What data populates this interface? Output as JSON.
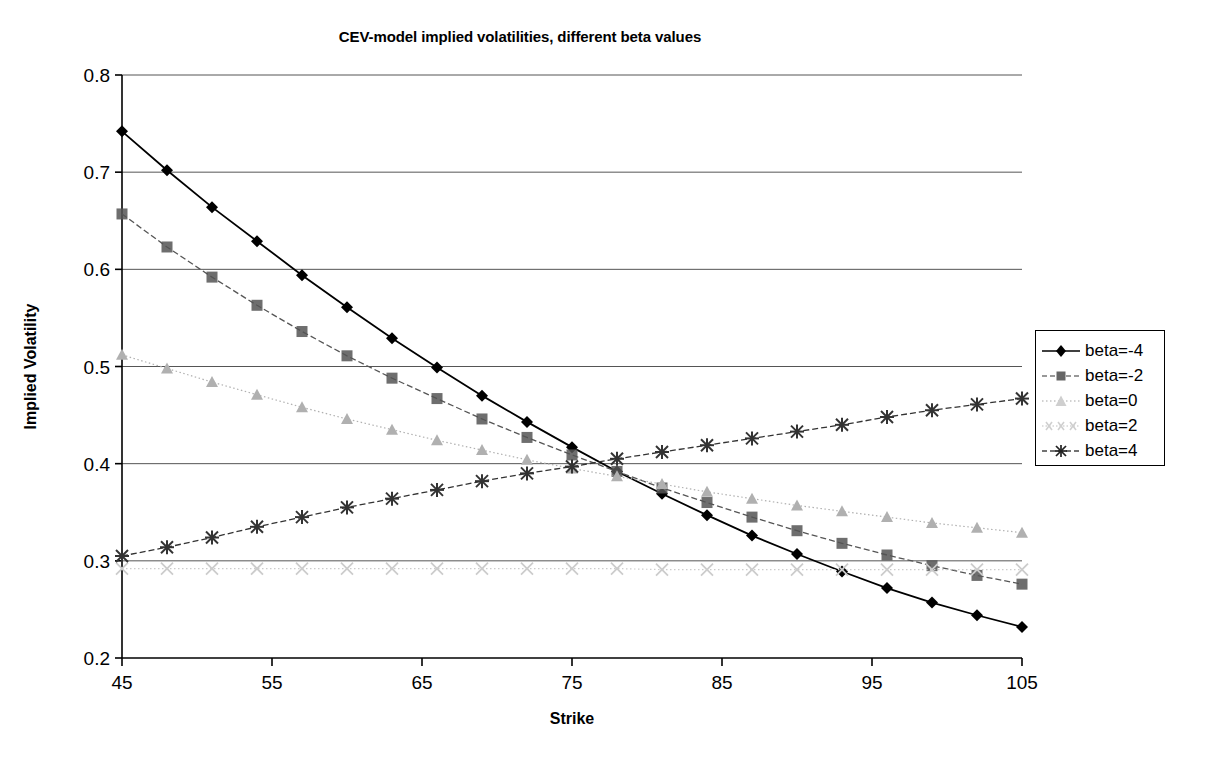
{
  "chart_data": {
    "type": "line",
    "title": "CEV-model implied volatilities, different beta values",
    "xlabel": "Strike",
    "ylabel": "Implied Volatility",
    "xlim": [
      45,
      105
    ],
    "ylim": [
      0.2,
      0.8
    ],
    "xticks": [
      45,
      55,
      65,
      75,
      85,
      95,
      105
    ],
    "yticks": [
      0.2,
      0.3,
      0.4,
      0.5,
      0.6,
      0.7,
      0.8
    ],
    "grid": "horizontal",
    "legend_position": "right",
    "x": [
      45,
      48,
      51,
      54,
      57,
      60,
      63,
      66,
      69,
      72,
      75,
      78,
      81,
      84,
      87,
      90,
      93,
      96,
      99,
      102,
      105
    ],
    "series": [
      {
        "name": "beta=-4",
        "marker": "diamond",
        "color": "#000000",
        "line_style": "solid",
        "values": [
          0.742,
          0.702,
          0.664,
          0.629,
          0.594,
          0.561,
          0.529,
          0.499,
          0.47,
          0.443,
          0.417,
          0.392,
          0.369,
          0.347,
          0.326,
          0.307,
          0.289,
          0.272,
          0.257,
          0.244,
          0.232
        ]
      },
      {
        "name": "beta=-2",
        "marker": "square",
        "color": "#555555",
        "line_style": "dashed",
        "values": [
          0.657,
          0.623,
          0.592,
          0.563,
          0.536,
          0.511,
          0.488,
          0.467,
          0.446,
          0.427,
          0.409,
          0.392,
          0.375,
          0.36,
          0.345,
          0.331,
          0.318,
          0.306,
          0.295,
          0.285,
          0.276
        ]
      },
      {
        "name": "beta=0",
        "marker": "triangle",
        "color": "#b0b0b0",
        "line_style": "dotted",
        "values": [
          0.512,
          0.498,
          0.484,
          0.471,
          0.458,
          0.446,
          0.435,
          0.424,
          0.414,
          0.404,
          0.395,
          0.387,
          0.379,
          0.371,
          0.364,
          0.357,
          0.351,
          0.345,
          0.339,
          0.334,
          0.329
        ]
      },
      {
        "name": "beta=2",
        "marker": "cross",
        "color": "#cccccc",
        "line_style": "dotted",
        "values": [
          0.292,
          0.292,
          0.292,
          0.292,
          0.292,
          0.292,
          0.292,
          0.292,
          0.292,
          0.292,
          0.292,
          0.292,
          0.291,
          0.291,
          0.291,
          0.291,
          0.291,
          0.291,
          0.291,
          0.291,
          0.291
        ]
      },
      {
        "name": "beta=4",
        "marker": "star",
        "color": "#333333",
        "line_style": "dashed",
        "values": [
          0.305,
          0.314,
          0.324,
          0.335,
          0.345,
          0.355,
          0.364,
          0.373,
          0.382,
          0.39,
          0.397,
          0.405,
          0.412,
          0.419,
          0.426,
          0.433,
          0.44,
          0.448,
          0.455,
          0.461,
          0.467
        ]
      }
    ]
  },
  "legend": {
    "items": [
      {
        "label": "beta=-4"
      },
      {
        "label": "beta=-2"
      },
      {
        "label": "beta=0"
      },
      {
        "label": "beta=2"
      },
      {
        "label": "beta=4"
      }
    ]
  }
}
